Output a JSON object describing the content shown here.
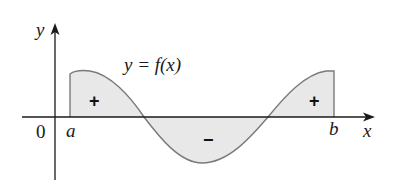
{
  "figure": {
    "function_label": "y = f(x)",
    "axis_labels": {
      "x": "x",
      "y": "y",
      "origin": "0"
    },
    "bounds": {
      "a": "a",
      "b": "b"
    },
    "region_signs": [
      "+",
      "−",
      "+"
    ]
  },
  "colors": {
    "axis": "#1a1a1a",
    "curve": "#7a7a7a",
    "fill": "#e8e8e8",
    "text": "#1a1a1a"
  }
}
